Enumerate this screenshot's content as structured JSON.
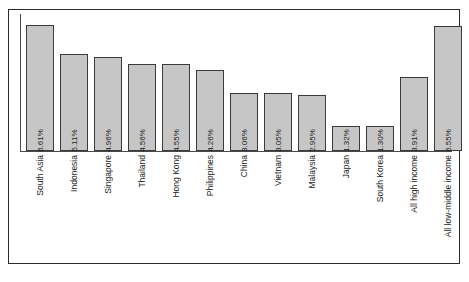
{
  "chart_data": {
    "type": "bar",
    "title": "",
    "subtitle": "",
    "xlabel": "",
    "ylabel": "",
    "ylim": [
      0,
      7.2
    ],
    "grid": false,
    "legend": null,
    "value_label_suffix": "%",
    "categories": [
      "South Asia",
      "Indonesia",
      "Singapore",
      "Thailand",
      "Hong Kong",
      "Philippines",
      "China",
      "Vietnam",
      "Malaysia",
      "Japan",
      "South Korea",
      "All high income",
      "All low-middle income"
    ],
    "values": [
      6.61,
      5.11,
      4.96,
      4.56,
      4.55,
      4.26,
      3.06,
      3.05,
      2.95,
      1.32,
      1.3,
      3.91,
      6.55
    ],
    "value_labels": [
      "6.61%",
      "5.11%",
      "4.96%",
      "4.56%",
      "4.55%",
      "4.26%",
      "3.06%",
      "3.05%",
      "2.95%",
      "1.32%",
      "1.30%",
      "3.91%",
      "6.55%"
    ],
    "colors": {
      "bar_fill": "#c6c6c6",
      "bar_border": "#3a3a3a",
      "axis": "#4a4a4a",
      "frame": "#2b2b2b",
      "text": "#1c1c1c",
      "background": "#ffffff"
    }
  }
}
